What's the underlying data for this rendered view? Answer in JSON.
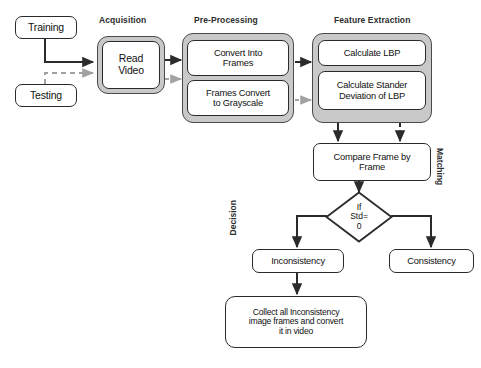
{
  "diagram": {
    "sections": {
      "acquisition": "Acquisition",
      "preprocessing": "Pre-Processing",
      "feature_extraction": "Feature Extraction"
    },
    "vertical_labels": {
      "decision": "Decision",
      "matching": "Matching"
    },
    "nodes": {
      "training": "Training",
      "testing": "Testing",
      "read_video": "Read\nVideo",
      "read_video_line1": "Read",
      "read_video_line2": "Video",
      "convert_into_frames_line1": "Convert Into",
      "convert_into_frames_line2": "Frames",
      "frames_convert_gray_line1": "Frames Convert",
      "frames_convert_gray_line2": "to Grayscale",
      "calculate_lbp": "Calculate LBP",
      "calculate_std_line1": "Calculate Stander",
      "calculate_std_line2": "Deviation of LBP",
      "compare_frame_line1": "Compare Frame by",
      "compare_frame_line2": "Frame",
      "decision_line1": "If",
      "decision_line2": "Std=",
      "decision_line3": "0",
      "inconsistency": "Inconsistency",
      "consistency": "Consistency",
      "collect_line1": "Collect all Inconsistency",
      "collect_line2": "image frames and convert",
      "collect_line3": "it in video"
    },
    "colors": {
      "group_fill": "#c9c9c9",
      "node_fill": "#ffffff",
      "stroke_solid": "#2b2b2b",
      "stroke_dashed": "#9a9a9a",
      "text": "#111111"
    },
    "edges": [
      {
        "from": "training",
        "to": "read_video",
        "style": "solid"
      },
      {
        "from": "testing",
        "to": "read_video",
        "style": "dashed"
      },
      {
        "from": "read_video",
        "to": "convert_into_frames",
        "style": "solid"
      },
      {
        "from": "read_video",
        "to": "frames_convert_gray",
        "style": "dashed"
      },
      {
        "from": "preprocessing",
        "to": "calculate_lbp",
        "style": "solid"
      },
      {
        "from": "preprocessing",
        "to": "calculate_std",
        "style": "dashed"
      },
      {
        "from": "feature_extraction",
        "to": "compare_frame",
        "style": "solid"
      },
      {
        "from": "feature_extraction",
        "to": "compare_frame",
        "style": "dashed"
      },
      {
        "from": "compare_frame",
        "to": "decision",
        "style": "solid"
      },
      {
        "from": "decision",
        "to": "inconsistency",
        "style": "solid"
      },
      {
        "from": "decision",
        "to": "consistency",
        "style": "solid"
      },
      {
        "from": "inconsistency",
        "to": "collect",
        "style": "solid"
      }
    ]
  }
}
